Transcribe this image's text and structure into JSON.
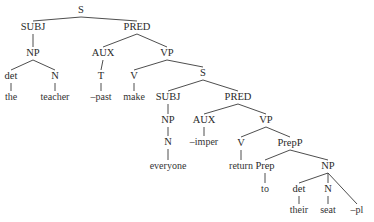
{
  "diagram": {
    "type": "syntax-tree",
    "nodes": [
      {
        "id": "s1",
        "label": "S",
        "x": 81,
        "y": 14,
        "kind": "cat"
      },
      {
        "id": "subj1",
        "label": "SUBJ",
        "x": 33,
        "y": 31,
        "kind": "cat"
      },
      {
        "id": "pred1",
        "label": "PRED",
        "x": 137,
        "y": 31,
        "kind": "cat"
      },
      {
        "id": "np1",
        "label": "NP",
        "x": 33,
        "y": 57,
        "kind": "cat"
      },
      {
        "id": "aux1",
        "label": "AUX",
        "x": 103,
        "y": 57,
        "kind": "cat"
      },
      {
        "id": "vp1",
        "label": "VP",
        "x": 167,
        "y": 57,
        "kind": "cat"
      },
      {
        "id": "det1",
        "label": "det",
        "x": 11,
        "y": 80,
        "kind": "cat"
      },
      {
        "id": "n1",
        "label": "N",
        "x": 55,
        "y": 80,
        "kind": "cat"
      },
      {
        "id": "t1",
        "label": "T",
        "x": 101,
        "y": 80,
        "kind": "cat"
      },
      {
        "id": "v1",
        "label": "V",
        "x": 134,
        "y": 80,
        "kind": "cat"
      },
      {
        "id": "s2",
        "label": "S",
        "x": 203,
        "y": 77,
        "kind": "cat"
      },
      {
        "id": "w_the",
        "label": "the",
        "x": 11,
        "y": 101,
        "kind": "word"
      },
      {
        "id": "w_teacher",
        "label": "teacher",
        "x": 55,
        "y": 101,
        "kind": "word"
      },
      {
        "id": "w_past",
        "label": "–past",
        "x": 101,
        "y": 101,
        "kind": "word"
      },
      {
        "id": "w_make",
        "label": "make",
        "x": 134,
        "y": 101,
        "kind": "word"
      },
      {
        "id": "subj2",
        "label": "SUBJ",
        "x": 168,
        "y": 101,
        "kind": "cat"
      },
      {
        "id": "pred2",
        "label": "PRED",
        "x": 238,
        "y": 101,
        "kind": "cat"
      },
      {
        "id": "np2",
        "label": "NP",
        "x": 168,
        "y": 124,
        "kind": "cat"
      },
      {
        "id": "aux2",
        "label": "AUX",
        "x": 204,
        "y": 124,
        "kind": "cat"
      },
      {
        "id": "vp2",
        "label": "VP",
        "x": 266,
        "y": 124,
        "kind": "cat"
      },
      {
        "id": "n2",
        "label": "N",
        "x": 168,
        "y": 146,
        "kind": "cat"
      },
      {
        "id": "w_imper",
        "label": "–imper",
        "x": 204,
        "y": 146,
        "kind": "word"
      },
      {
        "id": "v2",
        "label": "V",
        "x": 241,
        "y": 147,
        "kind": "cat"
      },
      {
        "id": "prepp",
        "label": "PrepP",
        "x": 290,
        "y": 147,
        "kind": "cat"
      },
      {
        "id": "w_everyone",
        "label": "everyone",
        "x": 168,
        "y": 170,
        "kind": "word"
      },
      {
        "id": "w_return",
        "label": "return",
        "x": 241,
        "y": 170,
        "kind": "word"
      },
      {
        "id": "prep",
        "label": "Prep",
        "x": 265,
        "y": 170,
        "kind": "cat"
      },
      {
        "id": "np3",
        "label": "NP",
        "x": 328,
        "y": 170,
        "kind": "cat"
      },
      {
        "id": "w_to",
        "label": "to",
        "x": 265,
        "y": 193,
        "kind": "word"
      },
      {
        "id": "det2",
        "label": "det",
        "x": 299,
        "y": 193,
        "kind": "cat"
      },
      {
        "id": "n3",
        "label": "N",
        "x": 328,
        "y": 193,
        "kind": "cat"
      },
      {
        "id": "w_their",
        "label": "their",
        "x": 299,
        "y": 214,
        "kind": "word"
      },
      {
        "id": "w_seat",
        "label": "seat",
        "x": 328,
        "y": 214,
        "kind": "word"
      },
      {
        "id": "w_pl",
        "label": "–pl",
        "x": 357,
        "y": 214,
        "kind": "word"
      }
    ],
    "edges": [
      [
        "s1",
        "subj1"
      ],
      [
        "s1",
        "pred1"
      ],
      [
        "subj1",
        "np1"
      ],
      [
        "np1",
        "det1"
      ],
      [
        "np1",
        "n1"
      ],
      [
        "det1",
        "w_the"
      ],
      [
        "n1",
        "w_teacher"
      ],
      [
        "pred1",
        "aux1"
      ],
      [
        "pred1",
        "vp1"
      ],
      [
        "aux1",
        "t1"
      ],
      [
        "t1",
        "w_past"
      ],
      [
        "vp1",
        "v1"
      ],
      [
        "vp1",
        "s2"
      ],
      [
        "v1",
        "w_make"
      ],
      [
        "s2",
        "subj2"
      ],
      [
        "s2",
        "pred2"
      ],
      [
        "subj2",
        "np2"
      ],
      [
        "np2",
        "n2"
      ],
      [
        "n2",
        "w_everyone"
      ],
      [
        "pred2",
        "aux2"
      ],
      [
        "pred2",
        "vp2"
      ],
      [
        "aux2",
        "w_imper"
      ],
      [
        "vp2",
        "v2"
      ],
      [
        "vp2",
        "prepp"
      ],
      [
        "v2",
        "w_return"
      ],
      [
        "prepp",
        "prep"
      ],
      [
        "prepp",
        "np3"
      ],
      [
        "prep",
        "w_to"
      ],
      [
        "np3",
        "det2"
      ],
      [
        "np3",
        "n3"
      ],
      [
        "np3",
        "w_pl"
      ],
      [
        "det2",
        "w_their"
      ],
      [
        "n3",
        "w_seat"
      ]
    ]
  }
}
